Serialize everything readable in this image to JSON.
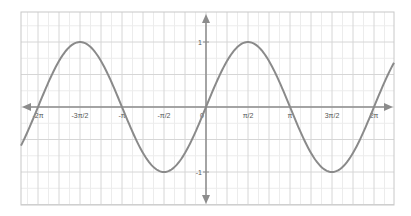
{
  "chart_data": {
    "type": "line",
    "title": "",
    "xlabel": "",
    "ylabel": "",
    "function": "y = sin(x)",
    "series": [
      {
        "name": "sin(x)",
        "x": [
          -7.4,
          -6.283,
          -5.498,
          -4.712,
          -3.927,
          -3.142,
          -2.356,
          -1.571,
          -0.785,
          0,
          0.785,
          1.571,
          2.356,
          3.142,
          3.927,
          4.712,
          5.498,
          6.283,
          7.3
        ],
        "values": [
          -0.9,
          0,
          0.707,
          1,
          0.707,
          0,
          -0.707,
          -1,
          -0.707,
          0,
          0.707,
          1,
          0.707,
          0,
          -0.707,
          -1,
          -0.707,
          0,
          0.85
        ]
      }
    ],
    "xlim": [
      -7.4,
      7.4
    ],
    "ylim": [
      -1.55,
      1.45
    ],
    "x_ticks": [
      {
        "value": -6.2832,
        "label": "-2π"
      },
      {
        "value": -4.7124,
        "label": "-3π/2"
      },
      {
        "value": -3.1416,
        "label": "-π"
      },
      {
        "value": -1.5708,
        "label": "-π/2"
      },
      {
        "value": 0,
        "label": "0"
      },
      {
        "value": 1.5708,
        "label": "π/2"
      },
      {
        "value": 3.1416,
        "label": "π"
      },
      {
        "value": 4.7124,
        "label": "3π/2"
      },
      {
        "value": 6.2832,
        "label": "2π"
      }
    ],
    "y_ticks": [
      {
        "value": 1,
        "label": "1"
      },
      {
        "value": -1,
        "label": "-1"
      }
    ],
    "grid": true,
    "legend": null,
    "colors": {
      "curve": "#8a8a8a",
      "axis": "#8c8c8c",
      "grid_major": "#d6d6d6",
      "grid_minor": "#ececec",
      "frame": "#c8c8c8"
    }
  }
}
